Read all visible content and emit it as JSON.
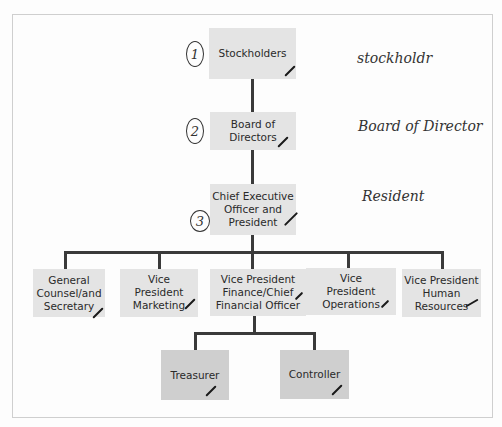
{
  "chart": {
    "nodes": {
      "stockholders": "Stockholders",
      "board": "Board of Directors",
      "ceo": "Chief Executive Officer and President",
      "general_counsel": "General Counsel/and Secretary",
      "vp_marketing": "Vice President Marketing",
      "vp_finance": "Vice President Finance/Chief Financial Officer",
      "vp_operations": "Vice President Operations",
      "vp_hr": "Vice President Human Resources",
      "treasurer": "Treasurer",
      "controller": "Controller"
    },
    "annotations": {
      "circled_numbers": [
        "1",
        "2",
        "3"
      ],
      "handwritten_labels": [
        "stockholdr",
        "Board of Director",
        "Resident"
      ],
      "checkmark": "✓"
    }
  }
}
